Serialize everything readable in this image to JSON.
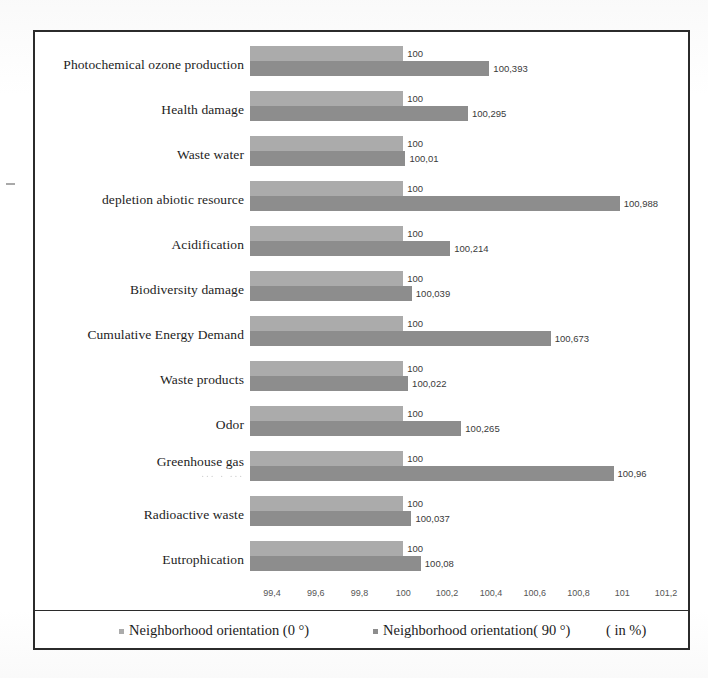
{
  "chart_data": {
    "type": "bar",
    "orientation": "horizontal",
    "title": "",
    "xlabel": "( in %)",
    "ylabel": "",
    "xlim": [
      99.3,
      101.3
    ],
    "xticks": [
      "99,4",
      "99,6",
      "99,8",
      "100",
      "100,2",
      "100,4",
      "100,6",
      "100,8",
      "101",
      "101,2"
    ],
    "xtick_values": [
      99.4,
      99.6,
      99.8,
      100,
      100.2,
      100.4,
      100.6,
      100.8,
      101,
      101.2
    ],
    "grid": false,
    "legend_position": "bottom",
    "categories": [
      "Photochemical ozone production",
      "Health damage",
      "Waste water",
      "depletion abiotic resource",
      "Acidification",
      "Biodiversity damage",
      "Cumulative Energy Demand",
      "Waste products",
      "Odor",
      "Greenhouse gas",
      "Radioactive waste",
      "Eutrophication"
    ],
    "category_sublabels": {
      "Greenhouse gas": "... . ..."
    },
    "series": [
      {
        "name": "Neighborhood orientation (0 °)",
        "color": "#ababab",
        "values": [
          100,
          100,
          100,
          100,
          100,
          100,
          100,
          100,
          100,
          100,
          100,
          100
        ],
        "labels": [
          "100",
          "100",
          "100",
          "100",
          "100",
          "100",
          "100",
          "100",
          "100",
          "100",
          "100",
          "100"
        ]
      },
      {
        "name": "Neighborhood orientation( 90 °)",
        "color": "#8d8d8d",
        "values": [
          100.393,
          100.295,
          100.01,
          100.988,
          100.214,
          100.039,
          100.673,
          100.022,
          100.265,
          100.96,
          100.037,
          100.08
        ],
        "labels": [
          "100,393",
          "100,295",
          "100,01",
          "100,988",
          "100,214",
          "100,039",
          "100,673",
          "100,022",
          "100,265",
          "100,96",
          "100,037",
          "100,08"
        ]
      }
    ]
  },
  "legend": {
    "series0_label": "Neighborhood orientation (0 °)",
    "series1_label": "Neighborhood orientation( 90 °)",
    "unit_label": "( in %)"
  }
}
